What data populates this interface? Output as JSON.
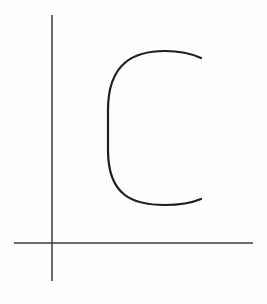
{
  "diagram": {
    "background": "#fefefe",
    "axis_color": "#3a3a3a",
    "curve_color": "#1e1e1e",
    "shape_label": "C",
    "x_axis": {
      "x1": 14,
      "y1": 243,
      "x2": 253,
      "y2": 243
    },
    "y_axis": {
      "x1": 52,
      "y1": 15,
      "x2": 52,
      "y2": 281
    },
    "c_curve": {
      "left": 107,
      "top": 51,
      "right": 201,
      "bottom": 205
    }
  }
}
